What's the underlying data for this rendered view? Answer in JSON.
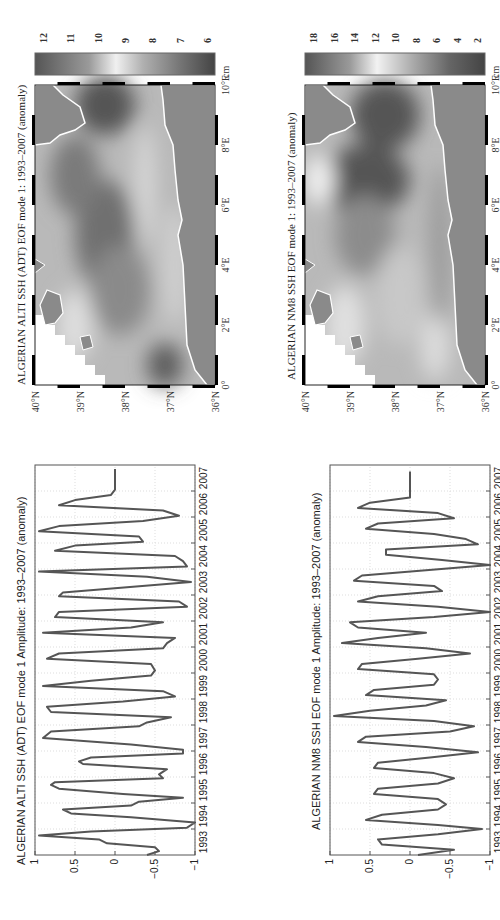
{
  "figure": {
    "orientation": "rotated 90 degrees counter-clockwise"
  },
  "panels": {
    "ts_alti": {
      "title": "ALGERIAN ALTI SSH (ADT) EOF mode 1 Amplitude: 1993–2007 (anomaly)"
    },
    "ts_nm8": {
      "title": "ALGERIAN NM8 SSH EOF mode 1 Amplitude: 1993–2007 (anomaly)"
    },
    "map_alti": {
      "title": "ALGERIAN ALTI SSH (ADT) EOF mode 1: 1993–2007 (anomaly)",
      "colorbar_unit": "cm",
      "colorbar_ticks": [
        "12",
        "11",
        "10",
        "9",
        "8",
        "7",
        "6"
      ]
    },
    "map_nm8": {
      "title": "ALGERIAN NM8 SSH EOF mode 1: 1993–2007 (anomaly)",
      "colorbar_unit": "cm",
      "colorbar_ticks": [
        "18",
        "16",
        "14",
        "12",
        "10",
        "8",
        "6",
        "4",
        "2"
      ]
    },
    "map_axes": {
      "lat_ticks": [
        "40°N",
        "39°N",
        "38°N",
        "37°N",
        "36°N"
      ],
      "lon_ticks": [
        "0°",
        "2°E",
        "4°E",
        "6°E",
        "8°E",
        "10°E"
      ]
    },
    "ts_axes": {
      "y_ticks": [
        "1",
        "0.5",
        "0",
        "−0.5",
        "−1"
      ],
      "x_ticks": [
        "1993",
        "1994",
        "1995",
        "1996",
        "1997",
        "1998",
        "1999",
        "2000",
        "2001",
        "2002",
        "2003",
        "2004",
        "2005",
        "2006",
        "2007"
      ]
    }
  },
  "chart_data": [
    {
      "type": "line",
      "title": "ALGERIAN ALTI SSH (ADT) EOF mode 1 Amplitude: 1993–2007 (anomaly)",
      "xlabel": "",
      "ylabel": "",
      "xlim": [
        1993,
        2008
      ],
      "ylim": [
        -1,
        1
      ],
      "grid": true,
      "x": [
        1993.0,
        1993.15,
        1993.3,
        1993.45,
        1993.6,
        1993.75,
        1993.9,
        1994.05,
        1994.25,
        1994.45,
        1994.6,
        1994.75,
        1994.9,
        1995.05,
        1995.2,
        1995.35,
        1995.55,
        1995.7,
        1995.8,
        1995.95,
        1996.1,
        1996.3,
        1996.5,
        1996.6,
        1996.75,
        1996.9,
        1997.05,
        1997.25,
        1997.5,
        1997.75,
        1997.95,
        1998.1,
        1998.3,
        1998.5,
        1998.7,
        1998.9,
        1999.1,
        1999.3,
        1999.5,
        1999.7,
        1999.9,
        2000.1,
        2000.35,
        2000.55,
        2000.75,
        2000.95,
        2001.15,
        2001.35,
        2001.55,
        2001.75,
        2001.95,
        2002.15,
        2002.35,
        2002.55,
        2002.75,
        2002.95,
        2003.1,
        2003.3,
        2003.5,
        2003.7,
        2003.9,
        2004.1,
        2004.3,
        2004.5,
        2004.7,
        2004.9,
        2005.05,
        2005.25,
        2005.45,
        2005.65,
        2005.85,
        2006.05,
        2006.25,
        2006.45,
        2006.65,
        2006.85,
        2007.05,
        2007.25,
        2007.45,
        2007.65,
        2007.85
      ],
      "series": [
        {
          "name": "EOF mode 1 amplitude",
          "values": [
            -0.4,
            -0.55,
            -0.5,
            0.1,
            0.2,
            0.95,
            0.3,
            -0.9,
            -1.0,
            -0.2,
            0.55,
            0.65,
            -0.2,
            -0.3,
            -0.85,
            -0.1,
            0.7,
            0.8,
            0.75,
            -0.6,
            -0.55,
            -0.65,
            0.4,
            0.45,
            0.3,
            -0.85,
            -0.85,
            -0.2,
            0.9,
            0.8,
            -0.3,
            -0.4,
            -0.7,
            0.8,
            0.85,
            -0.1,
            -0.75,
            -0.6,
            0.9,
            0.3,
            -0.45,
            -0.5,
            -0.45,
            0.85,
            0.7,
            -0.6,
            -0.65,
            -0.75,
            0.9,
            -0.2,
            -0.6,
            0.75,
            0.7,
            -0.9,
            -0.8,
            0.7,
            0.65,
            -0.15,
            -0.95,
            -0.4,
            0.95,
            -0.9,
            -0.85,
            -0.75,
            0.75,
            0.5,
            -0.35,
            -0.3,
            0.95,
            0.7,
            -0.35,
            -0.8,
            -0.6,
            0.7,
            0.5,
            0.05,
            0.0,
            0.0,
            0.0,
            0.0,
            0.0
          ]
        }
      ]
    },
    {
      "type": "line",
      "title": "ALGERIAN NM8 SSH EOF mode 1 Amplitude: 1993–2007 (anomaly)",
      "xlabel": "",
      "ylabel": "",
      "xlim": [
        1993,
        2008
      ],
      "ylim": [
        -1,
        1
      ],
      "grid": true,
      "x": [
        1993.0,
        1993.2,
        1993.4,
        1993.6,
        1993.8,
        1994.0,
        1994.15,
        1994.35,
        1994.55,
        1994.75,
        1994.95,
        1995.15,
        1995.35,
        1995.55,
        1995.75,
        1995.95,
        1996.15,
        1996.35,
        1996.55,
        1996.75,
        1996.95,
        1997.15,
        1997.35,
        1997.55,
        1997.75,
        1997.95,
        1998.15,
        1998.35,
        1998.55,
        1998.75,
        1998.95,
        1999.15,
        1999.35,
        1999.55,
        1999.75,
        1999.95,
        2000.15,
        2000.35,
        2000.55,
        2000.75,
        2000.95,
        2001.15,
        2001.35,
        2001.55,
        2001.75,
        2001.95,
        2002.15,
        2002.35,
        2002.55,
        2002.75,
        2002.95,
        2003.15,
        2003.35,
        2003.55,
        2003.75,
        2003.95,
        2004.15,
        2004.35,
        2004.55,
        2004.75,
        2004.95,
        2005.15,
        2005.35,
        2005.55,
        2005.75,
        2005.95,
        2006.15,
        2006.35,
        2006.55,
        2006.75,
        2006.95,
        2007.15,
        2007.35,
        2007.55,
        2007.75
      ],
      "series": [
        {
          "name": "EOF mode 1 amplitude",
          "values": [
            -0.1,
            -0.55,
            0.35,
            0.4,
            -0.35,
            -0.9,
            -0.35,
            0.55,
            0.35,
            -0.35,
            -0.45,
            -0.35,
            0.45,
            0.4,
            -0.35,
            -0.55,
            -0.3,
            0.45,
            0.4,
            -0.25,
            -0.85,
            -0.2,
            0.65,
            0.55,
            -0.5,
            -0.8,
            -0.3,
            0.95,
            0.5,
            -0.2,
            -0.45,
            0.55,
            0.45,
            -0.3,
            -0.35,
            -0.3,
            0.65,
            0.6,
            -0.1,
            -0.75,
            -0.2,
            0.85,
            0.4,
            -0.2,
            0.65,
            0.75,
            -0.3,
            -1.0,
            -0.35,
            0.65,
            0.4,
            -0.4,
            -0.3,
            0.7,
            0.6,
            -0.2,
            -1.0,
            -0.4,
            0.3,
            0.3,
            -0.85,
            -0.7,
            -0.3,
            0.55,
            0.4,
            -0.55,
            -0.35,
            0.65,
            0.5,
            0.0,
            0.0,
            0.0,
            0.0,
            0.0,
            0.0
          ]
        }
      ]
    }
  ]
}
